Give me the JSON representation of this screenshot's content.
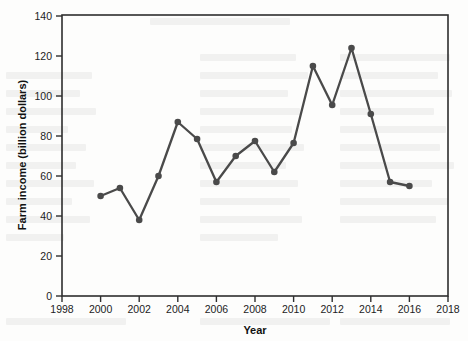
{
  "chart_data": {
    "type": "line",
    "title": "",
    "xlabel": "Year",
    "ylabel": "Farm income (billion dollars)",
    "xlim": [
      1998,
      2018
    ],
    "ylim": [
      0,
      140
    ],
    "xticks": [
      1998,
      2000,
      2002,
      2004,
      2006,
      2008,
      2010,
      2012,
      2014,
      2016,
      2018
    ],
    "yticks": [
      0,
      20,
      40,
      60,
      80,
      100,
      120,
      140
    ],
    "grid": false,
    "legend": false,
    "legend_position": "none",
    "marker": "circle",
    "series_color": "#4a4a4a",
    "x": [
      2000,
      2001,
      2002,
      2003,
      2004,
      2005,
      2006,
      2007,
      2008,
      2009,
      2010,
      2011,
      2012,
      2013,
      2014,
      2015,
      2016
    ],
    "values": [
      50,
      54,
      38,
      60,
      87,
      78.5,
      57,
      70,
      77.5,
      62,
      76.5,
      115,
      95.5,
      124,
      91,
      57,
      55
    ],
    "points": [
      {
        "year": 2000,
        "income": 50
      },
      {
        "year": 2001,
        "income": 54
      },
      {
        "year": 2002,
        "income": 38
      },
      {
        "year": 2003,
        "income": 60
      },
      {
        "year": 2004,
        "income": 87
      },
      {
        "year": 2005,
        "income": 78.5
      },
      {
        "year": 2006,
        "income": 57
      },
      {
        "year": 2007,
        "income": 70
      },
      {
        "year": 2008,
        "income": 77.5
      },
      {
        "year": 2009,
        "income": 62
      },
      {
        "year": 2010,
        "income": 76.5
      },
      {
        "year": 2011,
        "income": 115
      },
      {
        "year": 2012,
        "income": 95.5
      },
      {
        "year": 2013,
        "income": 124
      },
      {
        "year": 2014,
        "income": 91
      },
      {
        "year": 2015,
        "income": 57
      },
      {
        "year": 2016,
        "income": 55
      }
    ]
  },
  "axes": {
    "x_title": "Year",
    "y_title": "Farm income (billion dollars)",
    "x_tick_labels": [
      "1998",
      "2000",
      "2002",
      "2004",
      "2006",
      "2008",
      "2010",
      "2012",
      "2014",
      "2016",
      "2018"
    ],
    "y_tick_labels": [
      "0",
      "20",
      "40",
      "60",
      "80",
      "100",
      "120",
      "140"
    ]
  },
  "colors": {
    "series": "#4a4a4a",
    "axis": "#2e2e2e",
    "text": "#1c1c1c",
    "background": "#fdfdfc"
  }
}
